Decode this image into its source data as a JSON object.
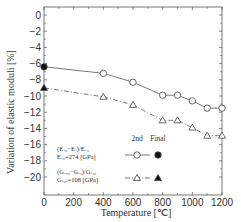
{
  "chart_data": {
    "type": "line",
    "title": "",
    "xlabel": "Temperature [℃]",
    "ylabel": "Variation of elastic moduli [%]",
    "xlim": [
      0,
      1200
    ],
    "ylim": [
      -20,
      0
    ],
    "xticks": [
      0,
      200,
      400,
      600,
      800,
      1000,
      1200
    ],
    "yticks": [
      0,
      -2,
      -4,
      -6,
      -8,
      -10,
      -12,
      -14,
      -16,
      -18,
      -20
    ],
    "grid": false,
    "legend_position": "lower-left inside",
    "legend_headers": [
      "2nd",
      "Final"
    ],
    "series": [
      {
        "name": "(Ex0-Ex)/Ex0, Ex0=274 [GPa]",
        "label_line1": "(Eₓ₀−Eₓ)/Eₓ₀",
        "label_line2": "Eₓ₀=274 [GPa]",
        "marker_2nd": "open circle",
        "marker_final": "filled circle",
        "line_style": "solid",
        "x": [
          400,
          600,
          800,
          900,
          1000,
          1100,
          1200
        ],
        "values": [
          -7.2,
          -8.3,
          -9.9,
          -9.9,
          -10.6,
          -11.5,
          -11.5
        ],
        "final": {
          "x": 0,
          "value": -6.4
        }
      },
      {
        "name": "(Gxy0-Gxy)/Gxy0, Gxy0=108 [GPa]",
        "label_line1": "(Gₓᵧ₀−Gₓᵧ)/Gₓᵧ₀",
        "label_line2": "Gₓᵧ₀=108 [GPa]",
        "marker_2nd": "open triangle",
        "marker_final": "filled triangle",
        "line_style": "dash-dot",
        "x": [
          400,
          600,
          800,
          900,
          1000,
          1100,
          1200
        ],
        "values": [
          -10.1,
          -11.1,
          -13.0,
          -13.0,
          -13.9,
          -14.9,
          -14.9
        ],
        "final": {
          "x": 0,
          "value": -9.0
        }
      }
    ]
  }
}
